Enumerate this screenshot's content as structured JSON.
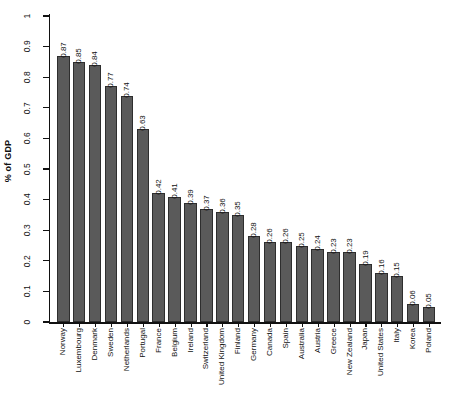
{
  "chart_data": {
    "type": "bar",
    "title": "",
    "xlabel": "",
    "ylabel": "% of GDP",
    "ylim": [
      0,
      1
    ],
    "ytick_labels": [
      "0",
      "0.1",
      "0.2",
      "0.3",
      "0.4",
      "0.5",
      "0.6",
      "0.7",
      "0.8",
      "0.9",
      "1"
    ],
    "ytick_values": [
      0,
      0.1,
      0.2,
      0.3,
      0.4,
      0.5,
      0.6,
      0.7,
      0.8,
      0.9,
      1
    ],
    "grid": false,
    "legend": false,
    "bar_color": "#5a5a5a",
    "bar_edge_color": "#2e2e2e",
    "axis_color": "#111111",
    "categories": [
      "Norway",
      "Luxembourg",
      "Denmark",
      "Sweden",
      "Netherlands",
      "Portugal",
      "France",
      "Belgium",
      "Ireland",
      "Switzerland",
      "United Kingdom",
      "Finland",
      "Germany",
      "Canada",
      "Spain",
      "Australia",
      "Austria",
      "Greece",
      "New Zealand",
      "Japan",
      "United States",
      "Italy",
      "Korea",
      "Poland"
    ],
    "values": [
      0.87,
      0.85,
      0.84,
      0.77,
      0.74,
      0.63,
      0.42,
      0.41,
      0.39,
      0.37,
      0.36,
      0.35,
      0.28,
      0.26,
      0.26,
      0.25,
      0.24,
      0.23,
      0.23,
      0.19,
      0.16,
      0.15,
      0.06,
      0.05
    ],
    "value_labels": [
      "0.87",
      "0.85",
      "0.84",
      "0.77",
      "0.74",
      "0.63",
      "0.42",
      "0.41",
      "0.39",
      "0.37",
      "0.36",
      "0.35",
      "0.28",
      "0.26",
      "0.26",
      "0.25",
      "0.24",
      "0.23",
      "0.23",
      "0.19",
      "0.16",
      "0.15",
      "0.06",
      "0.05"
    ]
  }
}
